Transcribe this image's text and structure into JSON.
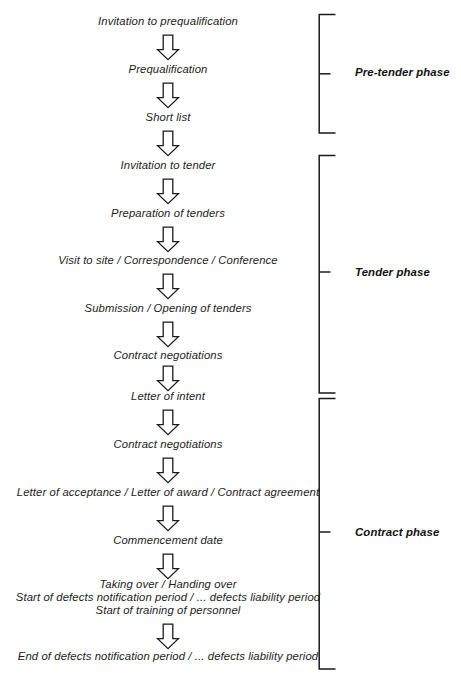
{
  "diagram": {
    "orientation": "vertical",
    "colors": {
      "background": "#ffffff",
      "text": "#1c1c1c",
      "stroke": "#1a1a1a"
    },
    "steps": [
      {
        "id": "invitation-to-prequalification",
        "label": "Invitation to prequalification"
      },
      {
        "id": "prequalification",
        "label": "Prequalification"
      },
      {
        "id": "short-list",
        "label": "Short list"
      },
      {
        "id": "invitation-to-tender",
        "label": "Invitation to tender"
      },
      {
        "id": "preparation-of-tenders",
        "label": "Preparation of tenders"
      },
      {
        "id": "visit-to-site",
        "label": "Visit to site / Correspondence / Conference"
      },
      {
        "id": "submission-opening-of-tenders",
        "label": "Submission / Opening of tenders"
      },
      {
        "id": "contract-negotiations-1",
        "label": "Contract negotiations"
      },
      {
        "id": "letter-of-intent",
        "label": "Letter of intent"
      },
      {
        "id": "contract-negotiations-2",
        "label": "Contract negotiations"
      },
      {
        "id": "letter-of-acceptance",
        "label": "Letter of acceptance / Letter of award / Contract agreement"
      },
      {
        "id": "commencement-date",
        "label": "Commencement date"
      },
      {
        "id": "taking-over",
        "line1": "Taking over / Handing over",
        "line2": "Start of defects notification period / ... defects liability period",
        "line3": "Start of training of personnel"
      },
      {
        "id": "end-of-defects",
        "label": "End of defects notification period / ... defects liability period"
      }
    ],
    "phases": [
      {
        "id": "pre-tender-phase",
        "label": "Pre-tender phase"
      },
      {
        "id": "tender-phase",
        "label": "Tender phase"
      },
      {
        "id": "contract-phase",
        "label": "Contract phase"
      }
    ],
    "connector": {
      "icon": "down-block-arrow",
      "count": 13
    }
  }
}
